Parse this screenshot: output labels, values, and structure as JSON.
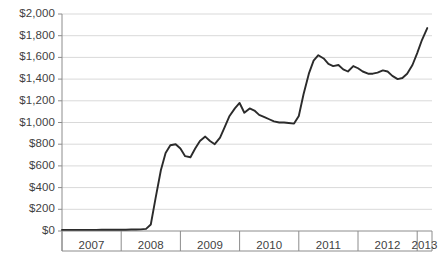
{
  "chart_data": {
    "type": "line",
    "title": "",
    "subtitle": "",
    "xlabel": "",
    "ylabel": "",
    "ylim": [
      0,
      2000
    ],
    "y_tick_step": 200,
    "grid": true,
    "legend": false,
    "legend_position": "none",
    "line_color": "#2b2b2b",
    "grid_color": "#d9d9d9",
    "axis_color": "#8c8c8c",
    "background_color": "#ffffff",
    "y_tick_labels": [
      "$2,000",
      "$1,800",
      "$1,600",
      "$1,400",
      "$1,200",
      "$1,000",
      "$800",
      "$600",
      "$400",
      "$200",
      "$0"
    ],
    "y_tick_values": [
      2000,
      1800,
      1600,
      1400,
      1200,
      1000,
      800,
      600,
      400,
      200,
      0
    ],
    "x_tick_labels": [
      "2007",
      "2008",
      "2009",
      "2010",
      "2011",
      "2012",
      "2013"
    ],
    "categories": [
      "2007.00",
      "2007.08",
      "2007.17",
      "2007.25",
      "2007.33",
      "2007.42",
      "2007.50",
      "2007.58",
      "2007.67",
      "2007.75",
      "2007.83",
      "2007.92",
      "2008.00",
      "2008.08",
      "2008.17",
      "2008.25",
      "2008.33",
      "2008.42",
      "2008.50",
      "2008.58",
      "2008.67",
      "2008.75",
      "2008.83",
      "2008.92",
      "2009.00",
      "2009.08",
      "2009.17",
      "2009.25",
      "2009.33",
      "2009.42",
      "2009.50",
      "2009.58",
      "2009.67",
      "2009.75",
      "2009.83",
      "2009.92",
      "2010.00",
      "2010.08",
      "2010.17",
      "2010.25",
      "2010.33",
      "2010.42",
      "2010.50",
      "2010.58",
      "2010.67",
      "2010.75",
      "2010.83",
      "2010.92",
      "2011.00",
      "2011.08",
      "2011.17",
      "2011.25",
      "2011.33",
      "2011.42",
      "2011.50",
      "2011.58",
      "2011.67",
      "2011.75",
      "2011.83",
      "2011.92",
      "2012.00",
      "2012.08",
      "2012.17",
      "2012.25",
      "2012.33",
      "2012.42",
      "2012.50",
      "2012.58",
      "2012.67",
      "2012.75",
      "2012.83",
      "2012.92",
      "2013.00",
      "2013.08",
      "2013.17"
    ],
    "values": [
      10,
      10,
      10,
      10,
      10,
      10,
      10,
      10,
      12,
      12,
      12,
      12,
      12,
      12,
      14,
      14,
      15,
      20,
      60,
      300,
      560,
      720,
      790,
      800,
      760,
      690,
      680,
      760,
      830,
      870,
      830,
      800,
      860,
      960,
      1060,
      1130,
      1180,
      1090,
      1130,
      1110,
      1070,
      1050,
      1030,
      1010,
      1000,
      1000,
      995,
      990,
      1060,
      1260,
      1450,
      1570,
      1620,
      1590,
      1540,
      1520,
      1530,
      1490,
      1470,
      1520,
      1500,
      1470,
      1450,
      1450,
      1460,
      1480,
      1470,
      1430,
      1400,
      1410,
      1450,
      1530,
      1640,
      1760,
      1870
    ],
    "series": [
      {
        "name": "value",
        "color": "#2b2b2b",
        "values": [
          10,
          10,
          10,
          10,
          10,
          10,
          10,
          10,
          12,
          12,
          12,
          12,
          12,
          12,
          14,
          14,
          15,
          20,
          60,
          300,
          560,
          720,
          790,
          800,
          760,
          690,
          680,
          760,
          830,
          870,
          830,
          800,
          860,
          960,
          1060,
          1130,
          1180,
          1090,
          1130,
          1110,
          1070,
          1050,
          1030,
          1010,
          1000,
          1000,
          995,
          990,
          1060,
          1260,
          1450,
          1570,
          1620,
          1590,
          1540,
          1520,
          1530,
          1490,
          1470,
          1520,
          1500,
          1470,
          1450,
          1450,
          1460,
          1480,
          1470,
          1430,
          1400,
          1410,
          1450,
          1530,
          1640,
          1760,
          1870
        ]
      }
    ],
    "annotations": []
  }
}
